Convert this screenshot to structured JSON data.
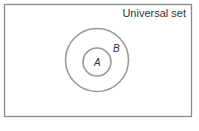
{
  "diagram": {
    "type": "venn",
    "universal_label": "Universal set",
    "sets": [
      {
        "name": "B",
        "label": "B",
        "contains": [
          "A"
        ]
      },
      {
        "name": "A",
        "label": "A",
        "subset_of": "B"
      }
    ],
    "colors": {
      "border": "#8a8a8a",
      "circle": "#9a9a9a",
      "text": "#333333"
    }
  }
}
